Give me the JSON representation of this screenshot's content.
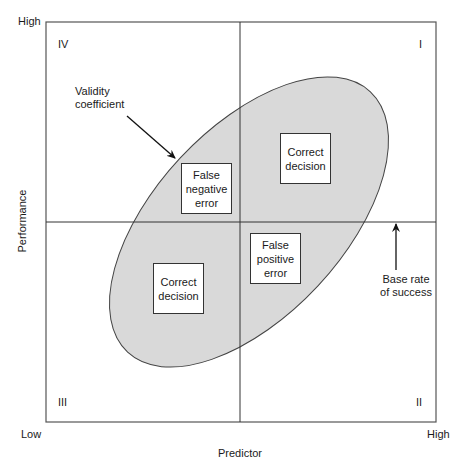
{
  "axes": {
    "x_label": "Predictor",
    "y_label": "Performance",
    "x_low": "Low",
    "x_high": "High",
    "y_high": "High"
  },
  "quadrants": {
    "q1": "I",
    "q2": "II",
    "q3": "III",
    "q4": "IV"
  },
  "boxes": {
    "correct_upper": [
      "Correct",
      "decision"
    ],
    "false_negative": [
      "False",
      "negative",
      "error"
    ],
    "false_positive": [
      "False",
      "positive",
      "error"
    ],
    "correct_lower": [
      "Correct",
      "decision"
    ]
  },
  "annotations": {
    "validity": [
      "Validity",
      "coefficient"
    ],
    "base_rate": [
      "Base rate",
      "of success"
    ]
  },
  "colors": {
    "ellipse_fill": "#d9d9d9",
    "line": "#333333",
    "frame": "#555555"
  }
}
